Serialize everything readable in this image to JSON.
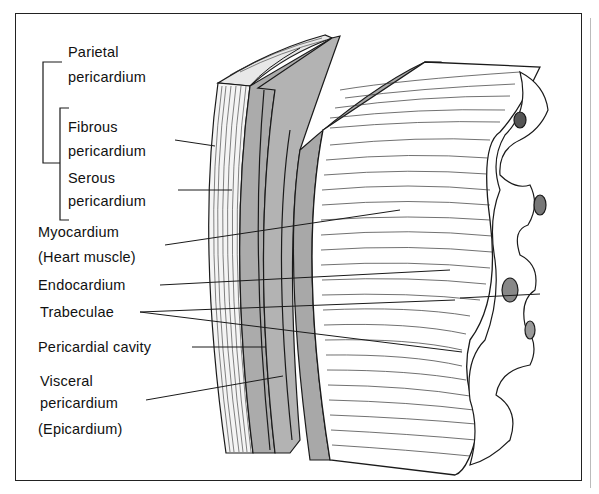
{
  "figure": {
    "labels": {
      "parietal_1": "Parietal",
      "parietal_2": "pericardium",
      "fibrous_1": "Fibrous",
      "fibrous_2": "pericardium",
      "serous_1": "Serous",
      "serous_2": "pericardium",
      "myocardium_1": "Myocardium",
      "myocardium_2": "(Heart muscle)",
      "endocardium": "Endocardium",
      "trabeculae": "Trabeculae",
      "pericardial_cavity": "Pericardial cavity",
      "visceral_1": "Visceral",
      "visceral_2": "pericardium",
      "visceral_3": "(Epicardium)"
    },
    "colors": {
      "line": "#1a1a1a",
      "shade": "#a9a9a9",
      "background": "#ffffff"
    }
  }
}
